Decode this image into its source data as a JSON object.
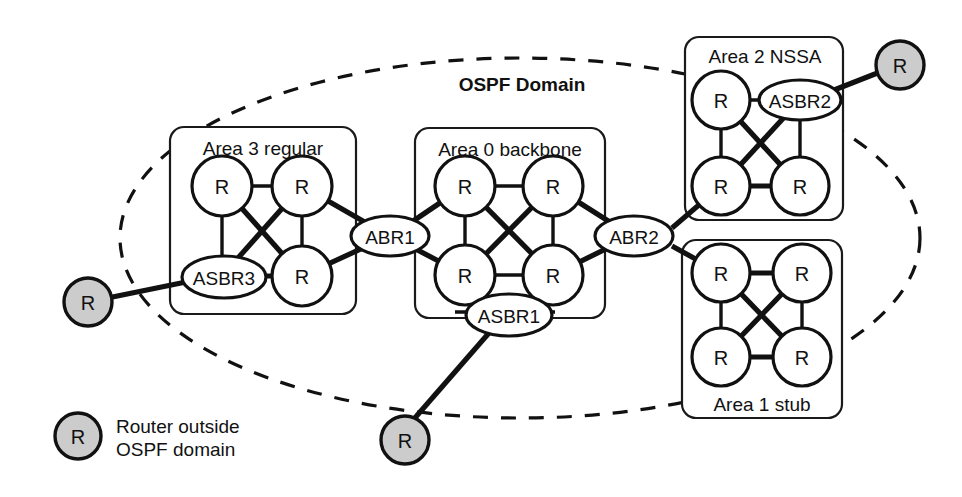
{
  "diagram": {
    "title": "OSPF Domain",
    "canvas": {
      "width": 962,
      "height": 497
    }
  },
  "areas": [
    {
      "id": "area3",
      "label": "Area 3 regular"
    },
    {
      "id": "area0",
      "label": "Area 0 backbone"
    },
    {
      "id": "area2",
      "label": "Area 2 NSSA"
    },
    {
      "id": "area1",
      "label": "Area 1 stub"
    }
  ],
  "nodes": {
    "area3_r_tl": "R",
    "area3_r_tr": "R",
    "area3_asbr3": "ASBR3",
    "area3_r_br": "R",
    "area0_r_tl": "R",
    "area0_r_tr": "R",
    "area0_r_bl": "R",
    "area0_r_br": "R",
    "area2_r_tl": "R",
    "area2_asbr2": "ASBR2",
    "area2_r_bl": "R",
    "area2_r_br": "R",
    "area1_r_tl": "R",
    "area1_r_tr": "R",
    "area1_r_bl": "R",
    "area1_r_br": "R",
    "abr1": "ABR1",
    "abr2": "ABR2",
    "asbr1": "ASBR1",
    "ext_left": "R",
    "ext_top_right": "R",
    "ext_bottom": "R"
  },
  "legend": {
    "symbol": "R",
    "line1": "Router outside",
    "line2": "OSPF domain"
  },
  "colors": {
    "stroke": "#111111",
    "external_fill": "#cccccc",
    "node_fill": "#ffffff",
    "background": "#ffffff"
  }
}
